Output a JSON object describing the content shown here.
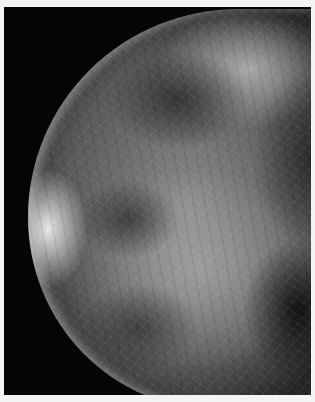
{
  "image": {
    "subject": "mammogram",
    "description": "Grayscale X-ray mammography view of breast tissue with fibroglandular density on black background, framed by thin white border",
    "colors": {
      "border": "#f4f4f4",
      "background": "#050505",
      "tissue_light": "#d8d8d8",
      "tissue_mid": "#8a8a8a",
      "tissue_dark": "#2a2a2a"
    }
  }
}
